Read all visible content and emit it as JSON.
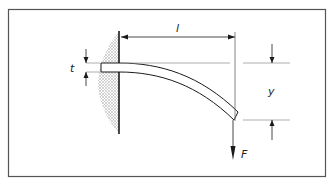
{
  "diagram": {
    "labels": {
      "thickness": "t",
      "length": "l",
      "deflection": "y",
      "force": "F"
    },
    "colors": {
      "stroke": "#1a1a1a",
      "frame": "#555555",
      "hatch": "#9a9a9a",
      "background": "#ffffff"
    }
  }
}
